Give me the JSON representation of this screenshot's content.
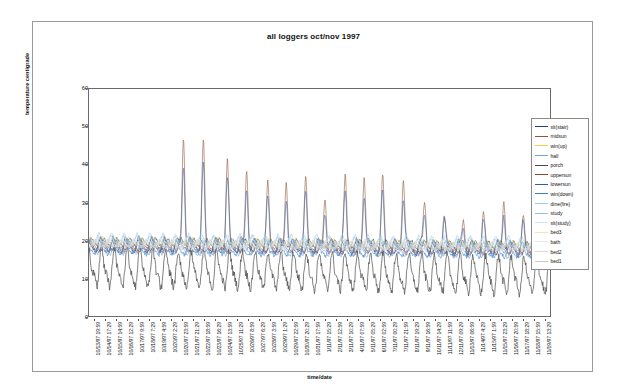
{
  "chart_data": {
    "type": "line",
    "title": "all loggers oct/nov 1997",
    "xlabel": "time/date",
    "ylabel": "temperature centigrade",
    "ylim": [
      0,
      60
    ],
    "yticks": [
      0,
      10,
      20,
      30,
      40,
      50,
      60
    ],
    "grid": false,
    "legend_position": "right",
    "x_tick_labels": [
      "10/13/97 19:59",
      "10/14/97 17:29",
      "10/15/97 14:59",
      "10/16/97 12:29",
      "10/17/97 9:59",
      "10/18/97 7:29",
      "10/19/97 4:59",
      "10/20/97 2:29",
      "10/20/97 23:59",
      "10/21/97 21:29",
      "10/22/97 18:59",
      "10/23/97 16:29",
      "10/24/97 13:59",
      "10/25/97 11:29",
      "10/26/97 8:59",
      "10/27/97 6:29",
      "10/28/97 3:59",
      "10/29/97 1:29",
      "10/29/97 22:59",
      "10/30/97 20:29",
      "10/31/97 17:59",
      "1/11/97 15:29",
      "2/11/97 12:59",
      "3/11/97 10:29",
      "4/11/97 07:59",
      "5/11/97 05:29",
      "6/11/97 02:59",
      "7/11/97 00:29",
      "7/11/97 21:59",
      "8/11/97 19:29",
      "9/11/97 16:59",
      "10/11/97 14:29",
      "11/11/97 11:59",
      "12/11/97 09:29",
      "11/13/97 06:59",
      "11/14/97 4:29",
      "11/15/97 1:59",
      "11/15/97 23:29",
      "11/16/97 20:59",
      "11/17/97 18:29",
      "11/18/97 15:59",
      "11/19/97 13:29"
    ],
    "series": [
      {
        "name": "sit(stair)",
        "color": "#1f3f7a",
        "baseline": 19.0,
        "amp": 1.4,
        "spike": 0,
        "phase": 0.0
      },
      {
        "name": "midsun",
        "color": "#9e4b4b",
        "baseline": 18.4,
        "amp": 1.2,
        "spike": 0,
        "phase": 0.35
      },
      {
        "name": "win(up)",
        "color": "#f5d142",
        "baseline": 19.6,
        "amp": 1.0,
        "spike": 0,
        "phase": 0.7
      },
      {
        "name": "hall",
        "color": "#6aa5dc",
        "baseline": 18.2,
        "amp": 1.6,
        "spike": 0,
        "phase": 1.05
      },
      {
        "name": "porch",
        "color": "#4a4a4a",
        "baseline": 12.5,
        "amp": 4.2,
        "spike": 0,
        "phase": 1.4
      },
      {
        "name": "uppersun",
        "color": "#8b4a2a",
        "baseline": 18.8,
        "amp": 1.5,
        "spike": 29.0,
        "phase": 1.75
      },
      {
        "name": "lowersun",
        "color": "#2e5fa3",
        "baseline": 18.6,
        "amp": 1.8,
        "spike": 22.0,
        "phase": 2.1
      },
      {
        "name": "win(down)",
        "color": "#3f7fc4",
        "baseline": 18.0,
        "amp": 1.7,
        "spike": 0,
        "phase": 2.45
      },
      {
        "name": "dine(fire)",
        "color": "#9ec9e8",
        "baseline": 20.2,
        "amp": 1.3,
        "spike": 0,
        "phase": 2.8
      },
      {
        "name": "study",
        "color": "#8fc2e3",
        "baseline": 19.8,
        "amp": 1.1,
        "spike": 0,
        "phase": 3.15
      },
      {
        "name": "sit(study)",
        "color": "#cfe3f2",
        "baseline": 20.0,
        "amp": 0.9,
        "spike": 0,
        "phase": 3.5
      },
      {
        "name": "bed3",
        "color": "#f2e2c0",
        "baseline": 19.2,
        "amp": 1.0,
        "spike": 0,
        "phase": 3.85
      },
      {
        "name": "bath",
        "color": "#eeeadd",
        "baseline": 19.4,
        "amp": 0.8,
        "spike": 0,
        "phase": 4.2
      },
      {
        "name": "bed2",
        "color": "#dcdcdc",
        "baseline": 18.9,
        "amp": 0.9,
        "spike": 0,
        "phase": 4.55
      },
      {
        "name": "bed1",
        "color": "#c9c9c9",
        "baseline": 19.1,
        "amp": 0.9,
        "spike": 0,
        "phase": 4.9
      }
    ],
    "spike_peaks": [
      {
        "x": 0.205,
        "height": 48.0
      },
      {
        "x": 0.248,
        "height": 45.5
      },
      {
        "x": 0.3,
        "height": 41.0
      },
      {
        "x": 0.342,
        "height": 39.5
      },
      {
        "x": 0.388,
        "height": 34.5
      },
      {
        "x": 0.428,
        "height": 36.5
      },
      {
        "x": 0.47,
        "height": 35.5
      },
      {
        "x": 0.512,
        "height": 32.5
      },
      {
        "x": 0.556,
        "height": 37.0
      },
      {
        "x": 0.597,
        "height": 38.5
      },
      {
        "x": 0.637,
        "height": 36.5
      },
      {
        "x": 0.682,
        "height": 38.0
      },
      {
        "x": 0.728,
        "height": 31.5
      },
      {
        "x": 0.77,
        "height": 28.0
      },
      {
        "x": 0.812,
        "height": 26.5
      },
      {
        "x": 0.855,
        "height": 27.5
      },
      {
        "x": 0.9,
        "height": 32.0
      },
      {
        "x": 0.942,
        "height": 26.0
      }
    ]
  }
}
